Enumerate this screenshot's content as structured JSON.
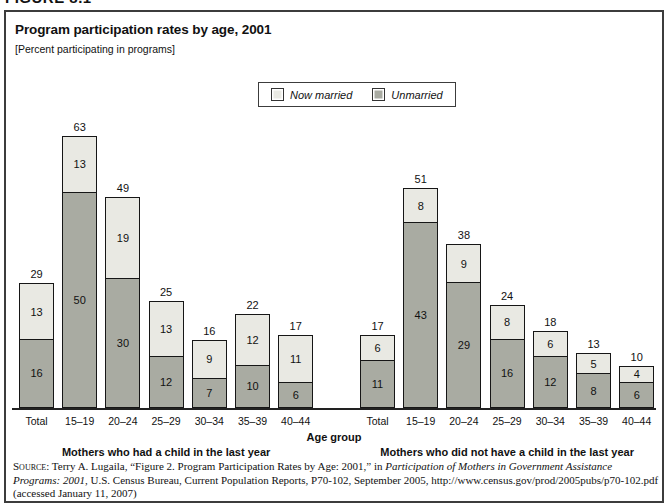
{
  "figure_label": "FIGURE 8.1",
  "header": {
    "title": "Program participation rates by age, 2001",
    "subtitle": "[Percent participating in programs]"
  },
  "legend": {
    "items": [
      {
        "label": "Now married",
        "color": "#e9e9e3"
      },
      {
        "label": "Unmarried",
        "color": "#a9aba2"
      }
    ]
  },
  "chart_data": {
    "type": "bar",
    "stacked": true,
    "title": "Program participation rates by age, 2001",
    "subtitle": "[Percent participating in programs]",
    "xlabel": "Age group",
    "legend": [
      "Now married",
      "Unmarried"
    ],
    "legend_position": "top-center",
    "grid": false,
    "colors": {
      "Now married": "#e9e9e3",
      "Unmarried": "#a9aba2"
    },
    "stack_order_bottom_to_top": [
      "Unmarried",
      "Now married"
    ],
    "groups": [
      {
        "label": "Mothers who had a child in the last year",
        "categories": [
          "Total",
          "15–19",
          "20–24",
          "25–29",
          "30–34",
          "35–39",
          "40–44"
        ],
        "series": [
          {
            "name": "Unmarried",
            "values": [
              16,
              50,
              30,
              12,
              7,
              10,
              6
            ]
          },
          {
            "name": "Now married",
            "values": [
              13,
              13,
              19,
              13,
              9,
              12,
              11
            ]
          }
        ],
        "totals": [
          29,
          63,
          49,
          25,
          16,
          22,
          17
        ]
      },
      {
        "label": "Mothers who did not have a child in the last year",
        "categories": [
          "Total",
          "15–19",
          "20–24",
          "25–29",
          "30–34",
          "35–39",
          "40–44"
        ],
        "series": [
          {
            "name": "Unmarried",
            "values": [
              11,
              43,
              29,
              16,
              12,
              8,
              6
            ]
          },
          {
            "name": "Now married",
            "values": [
              6,
              8,
              9,
              8,
              6,
              5,
              4
            ]
          }
        ],
        "totals": [
          17,
          51,
          38,
          24,
          18,
          13,
          10
        ]
      }
    ]
  },
  "source": {
    "label": "Source:",
    "pre_italic": " Terry A. Lugaila, “Figure 2. Program Participation Rates by Age: 2001,” in ",
    "italic": "Participation of Mothers in Government Assistance Programs: 2001",
    "post_italic": ", U.S. Census Bureau, Current Population Reports, P70-102, September 2005, http://www.census.gov/prod/2005pubs/p70-102.pdf (accessed January 11, 2007)"
  }
}
